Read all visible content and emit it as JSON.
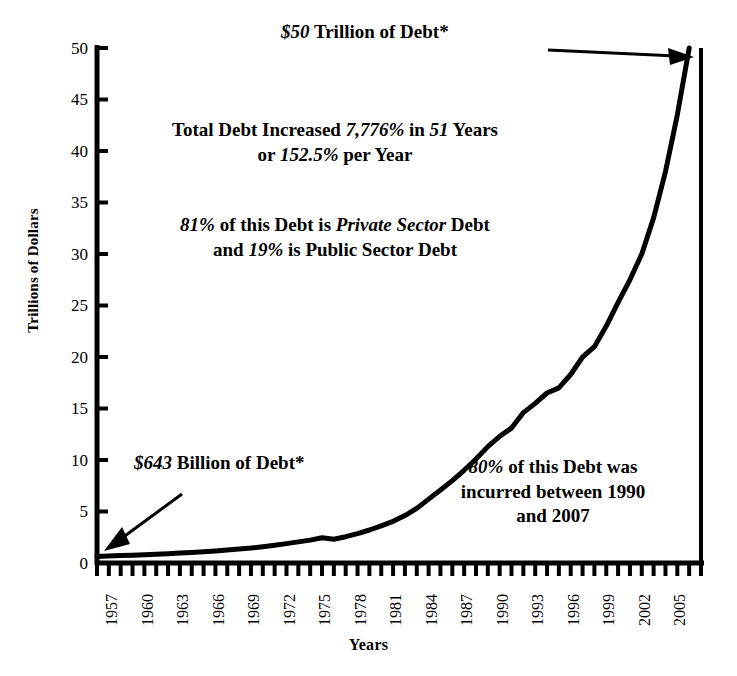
{
  "chart_data": {
    "type": "line",
    "title": "",
    "subtitle": "",
    "xlabel": "Years",
    "ylabel": "Trillions of Dollars",
    "xlim": [
      1957,
      2008
    ],
    "ylim": [
      0,
      50
    ],
    "yticks": [
      0,
      5,
      10,
      15,
      20,
      25,
      30,
      35,
      40,
      45,
      50
    ],
    "xticks": [
      1957,
      1960,
      1963,
      1966,
      1969,
      1972,
      1975,
      1978,
      1981,
      1984,
      1987,
      1990,
      1993,
      1996,
      1999,
      2002,
      2005
    ],
    "xtick_labels": [
      "1957",
      "1960",
      "1963",
      "1966",
      "1969",
      "1972",
      "1975",
      "1978",
      "1981",
      "1984",
      "1987",
      "1990",
      "1993",
      "1996",
      "1999",
      "2002",
      "2005"
    ],
    "minor_xtick_interval": 1,
    "grid": false,
    "legend": "none",
    "line_color": "#000000",
    "line_width_px": 5,
    "series": [
      {
        "name": "Total Debt",
        "x": [
          1957,
          1958,
          1959,
          1960,
          1961,
          1962,
          1963,
          1964,
          1965,
          1966,
          1967,
          1968,
          1969,
          1970,
          1971,
          1972,
          1973,
          1974,
          1975,
          1976,
          1977,
          1978,
          1979,
          1980,
          1981,
          1982,
          1983,
          1984,
          1985,
          1986,
          1987,
          1988,
          1989,
          1990,
          1991,
          1992,
          1993,
          1994,
          1995,
          1996,
          1997,
          1998,
          1999,
          2000,
          2001,
          2002,
          2003,
          2004,
          2005,
          2006,
          2007
        ],
        "y": [
          0.64,
          0.68,
          0.72,
          0.76,
          0.8,
          0.85,
          0.9,
          0.96,
          1.02,
          1.09,
          1.17,
          1.26,
          1.36,
          1.46,
          1.58,
          1.72,
          1.88,
          2.05,
          2.22,
          2.45,
          2.3,
          2.55,
          2.85,
          3.2,
          3.6,
          4.05,
          4.6,
          5.3,
          6.2,
          7.1,
          8.0,
          9.0,
          10.1,
          11.3,
          12.3,
          13.1,
          14.6,
          15.5,
          16.5,
          17.0,
          18.3,
          20.0,
          21.0,
          23.0,
          25.3,
          27.5,
          30.0,
          33.5,
          38.0,
          43.5,
          50.0
        ]
      }
    ],
    "annotations": [
      {
        "name": "peak-label",
        "text": "$50 Trillion of Debt*",
        "italic_parts": [
          "$50"
        ],
        "points_to": [
          2007,
          50
        ]
      },
      {
        "name": "start-label",
        "text": "$643 Billion of Debt*",
        "italic_parts": [
          "$643"
        ],
        "points_to": [
          1957,
          0.64
        ]
      },
      {
        "name": "total-increase",
        "text": "Total Debt Increased 7,776% in 51 Years or 152.5% per Year",
        "italic_parts": [
          "7,776%",
          "51",
          "152.5%"
        ]
      },
      {
        "name": "sector-split",
        "text": "81% of this Debt is Private Sector Debt and 19% is Public Sector Debt",
        "italic_parts": [
          "81%",
          "Private Sector",
          "19%"
        ]
      },
      {
        "name": "recent-share",
        "text": "80% of this Debt was incurred between 1990 and 2007",
        "italic_parts": [
          "80%"
        ]
      }
    ]
  },
  "axes": {
    "y_title": "Trillions of Dollars",
    "x_title": "Years",
    "y_ticks": [
      "50",
      "45",
      "40",
      "35",
      "30",
      "25",
      "20",
      "15",
      "10",
      "5",
      "0"
    ],
    "x_ticks": [
      "1957",
      "1960",
      "1963",
      "1966",
      "1969",
      "1972",
      "1975",
      "1978",
      "1981",
      "1984",
      "1987",
      "1990",
      "1993",
      "1996",
      "1999",
      "2002",
      "2005"
    ]
  },
  "annotations": {
    "peak": {
      "pre": "",
      "em": "$50",
      "post": " Trillion of Debt*"
    },
    "start": {
      "em": "$643",
      "post": " Billion of Debt*"
    },
    "total_increase": {
      "line1_pre": "Total Debt Increased ",
      "line1_em1": "7,776%",
      "line1_mid": " in ",
      "line1_em2": "51",
      "line1_post": " Years",
      "line2_pre": "or ",
      "line2_em": "152.5%",
      "line2_post": " per Year"
    },
    "sector_split": {
      "line1_em1": "81%",
      "line1_mid": " of this Debt is ",
      "line1_em2": "Private Sector",
      "line1_post": " Debt",
      "line2_pre": "and ",
      "line2_em": "19%",
      "line2_post": " is Public Sector Debt"
    },
    "recent_share": {
      "line1_em": "80%",
      "line1_post": " of this Debt was",
      "line2": "incurred between 1990",
      "line3": "and 2007"
    }
  },
  "colors": {
    "background": "#ffffff",
    "ink": "#000000",
    "line": "#000000"
  }
}
